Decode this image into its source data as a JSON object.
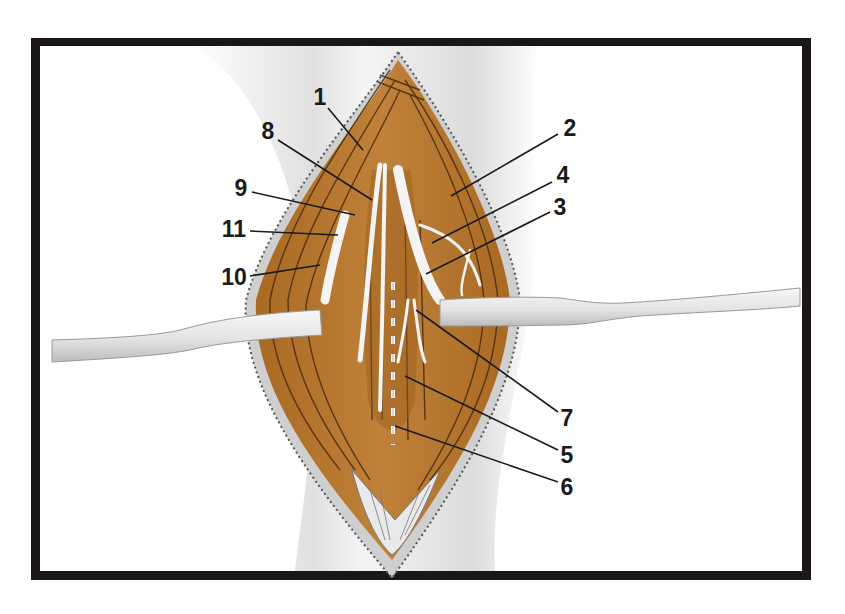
{
  "figure": {
    "type": "anatomical-illustration",
    "colors": {
      "frame": "#1b1716",
      "background": "#ffffff",
      "muscle": "#b8782c",
      "muscle_dark": "#8a5418",
      "muscle_line": "#4a2a0c",
      "nerve": "#f4f4f4",
      "retractor": "#e2e2e2",
      "skin_shadow": "#cfcfcf",
      "label_text": "#1a1a1a"
    }
  },
  "labels": [
    {
      "id": "1",
      "text": "1",
      "x": 320,
      "y": 97,
      "tip_x": 363,
      "tip_y": 150
    },
    {
      "id": "2",
      "text": "2",
      "x": 570,
      "y": 128,
      "tip_x": 451,
      "tip_y": 196
    },
    {
      "id": "3",
      "text": "3",
      "x": 560,
      "y": 207,
      "tip_x": 426,
      "tip_y": 274
    },
    {
      "id": "4",
      "text": "4",
      "x": 563,
      "y": 175,
      "tip_x": 432,
      "tip_y": 243
    },
    {
      "id": "5",
      "text": "5",
      "x": 567,
      "y": 455,
      "tip_x": 405,
      "tip_y": 376
    },
    {
      "id": "6",
      "text": "6",
      "x": 567,
      "y": 487,
      "tip_x": 395,
      "tip_y": 426
    },
    {
      "id": "7",
      "text": "7",
      "x": 567,
      "y": 418,
      "tip_x": 416,
      "tip_y": 310
    },
    {
      "id": "8",
      "text": "8",
      "x": 268,
      "y": 131,
      "tip_x": 372,
      "tip_y": 200
    },
    {
      "id": "9",
      "text": "9",
      "x": 241,
      "y": 188,
      "tip_x": 355,
      "tip_y": 215
    },
    {
      "id": "11",
      "text": "11",
      "x": 234,
      "y": 229,
      "tip_x": 338,
      "tip_y": 235
    },
    {
      "id": "10",
      "text": "10",
      "x": 234,
      "y": 277,
      "tip_x": 320,
      "tip_y": 265
    }
  ]
}
